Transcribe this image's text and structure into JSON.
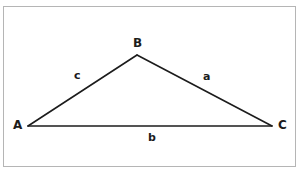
{
  "figure": {
    "kind": "geometry-diagram",
    "shape": "triangle",
    "background_color": "#ffffff",
    "frame": {
      "border_color": "#b5b5b5",
      "fill_color": "#ffffff"
    },
    "stroke_color": "#1c1c1c",
    "text_color": "#1c1c1c",
    "vertices": [
      {
        "id": "A",
        "label": "A",
        "x": 28,
        "y": 126,
        "label_x": 13,
        "label_y": 119
      },
      {
        "id": "B",
        "label": "B",
        "x": 137,
        "y": 55,
        "label_x": 133,
        "label_y": 37
      },
      {
        "id": "C",
        "label": "C",
        "x": 272,
        "y": 126,
        "label_x": 278,
        "label_y": 119
      }
    ],
    "sides": [
      {
        "id": "a",
        "label": "a",
        "from": "B",
        "to": "C",
        "label_x": 203,
        "label_y": 71
      },
      {
        "id": "b",
        "label": "b",
        "from": "A",
        "to": "C",
        "label_x": 148,
        "label_y": 132
      },
      {
        "id": "c",
        "label": "c",
        "from": "A",
        "to": "B",
        "label_x": 74,
        "label_y": 70
      }
    ]
  }
}
